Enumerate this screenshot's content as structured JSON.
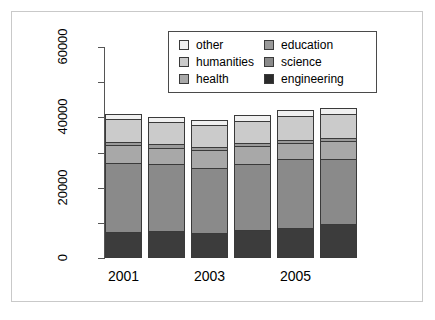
{
  "chart_data": {
    "type": "bar",
    "subtype": "stacked-bar",
    "title": "",
    "xlabel": "",
    "ylabel": "",
    "categories": [
      "2001",
      "2002",
      "2003",
      "2004",
      "2005",
      "2006"
    ],
    "visible_xtick_labels": [
      "2001",
      "2003",
      "2005"
    ],
    "ylim": [
      0,
      60000
    ],
    "ytick_labels": [
      "0",
      "20000",
      "40000",
      "60000"
    ],
    "ytick_values": [
      0,
      20000,
      40000,
      60000
    ],
    "minor_ytick_values": [
      10000,
      30000,
      50000
    ],
    "grid": false,
    "legend_position": "top-center",
    "series": [
      {
        "name": "engineering",
        "color": "#3c3c3c",
        "values": [
          7400,
          7600,
          7200,
          8000,
          8600,
          9700
        ]
      },
      {
        "name": "science",
        "color": "#8a8a8a",
        "values": [
          19700,
          19000,
          18400,
          18600,
          19700,
          18500
        ]
      },
      {
        "name": "health",
        "color": "#a8a8a8",
        "values": [
          5100,
          4800,
          5000,
          5200,
          4500,
          5100
        ]
      },
      {
        "name": "education",
        "color": "#9a9a9a",
        "values": [
          800,
          900,
          900,
          800,
          800,
          900
        ]
      },
      {
        "name": "humanities",
        "color": "#cbcbcb",
        "values": [
          6600,
          6500,
          6400,
          6500,
          6900,
          6900
        ]
      },
      {
        "name": "other",
        "color": "#f0f0f0",
        "values": [
          1300,
          1400,
          1400,
          1500,
          1600,
          1700
        ]
      }
    ],
    "totals": [
      40900,
      40200,
      39300,
      40600,
      42100,
      42800
    ]
  },
  "legend": {
    "columns": [
      [
        {
          "label": "other",
          "color": "#f0f0f0"
        },
        {
          "label": "humanities",
          "color": "#cbcbcb"
        },
        {
          "label": "health",
          "color": "#a8a8a8"
        }
      ],
      [
        {
          "label": "education",
          "color": "#9a9a9a"
        },
        {
          "label": "science",
          "color": "#8a8a8a"
        },
        {
          "label": "engineering",
          "color": "#2b2b2b"
        }
      ]
    ]
  },
  "axes": {
    "y_labels": [
      "0",
      "20000",
      "40000",
      "60000"
    ],
    "x_labels": [
      "2001",
      "2003",
      "2005"
    ]
  }
}
